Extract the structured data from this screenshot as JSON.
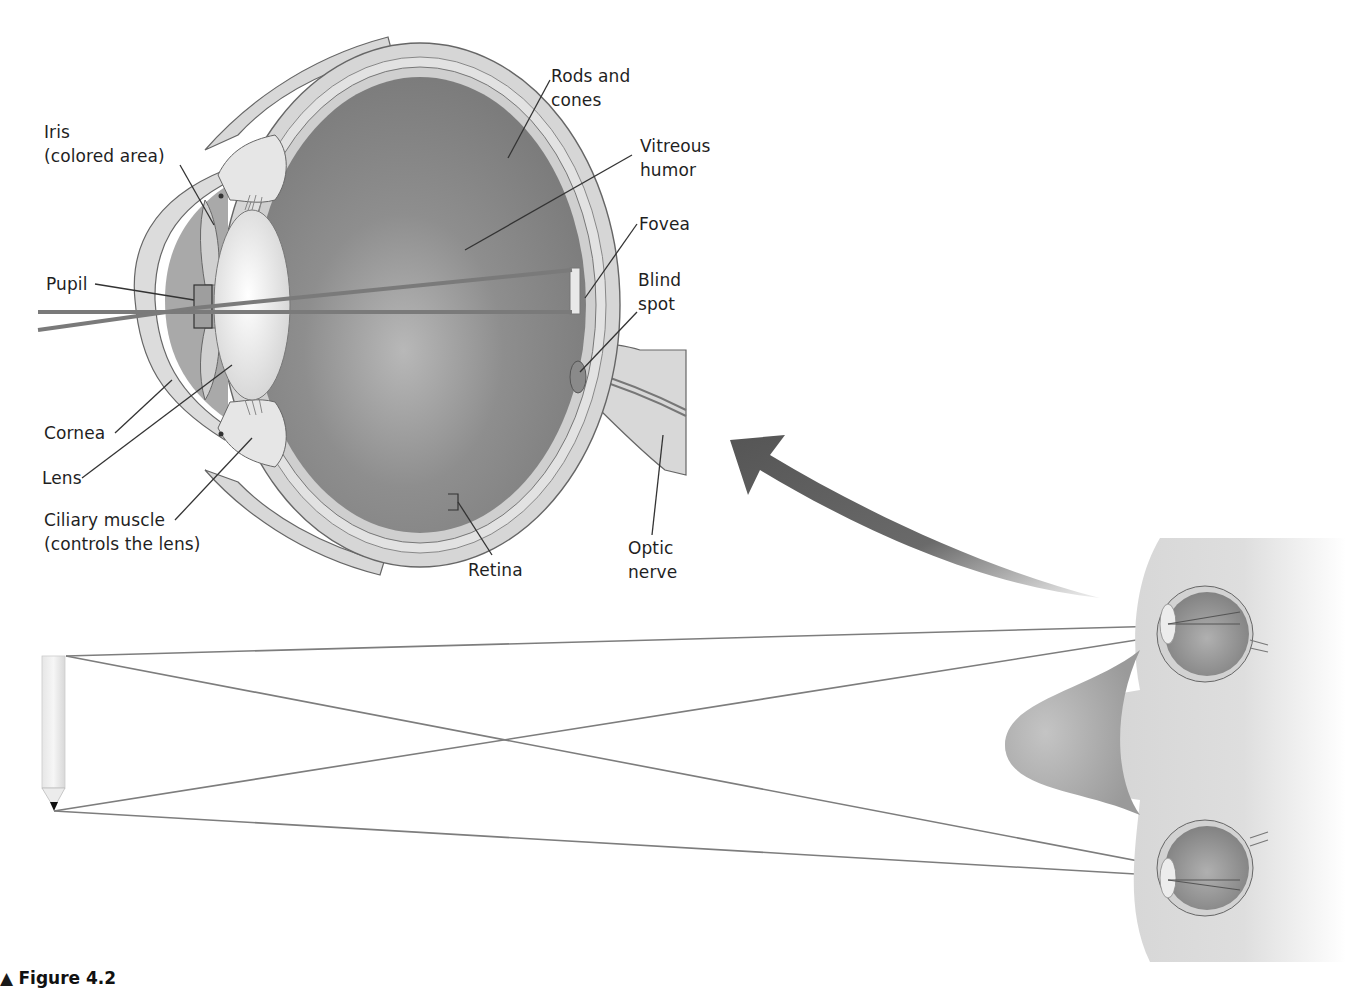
{
  "figure": {
    "caption_marker": "▲",
    "caption_label": "Figure 4.2",
    "caption_text": "The human eye (caption cut off at image bottom)"
  },
  "eye_cross_section": {
    "labels": {
      "iris": "Iris\n(colored area)",
      "pupil": "Pupil",
      "cornea": "Cornea",
      "lens": "Lens",
      "ciliary_muscle": "Ciliary muscle\n(controls the lens)",
      "rods_cones": "Rods and\ncones",
      "vitreous_humor": "Vitreous\nhumor",
      "fovea": "Fovea",
      "blind_spot": "Blind\nspot",
      "retina": "Retina",
      "optic_nerve": "Optic\nnerve"
    }
  },
  "binocular_view": {
    "object": "pencil",
    "rays": 4,
    "viewer": "face-profile-with-two-eyes"
  },
  "colors": {
    "background": "#ffffff",
    "eye_interior": "#8a8a8a",
    "sclera": "#d6d6d6",
    "lens": "#ececec",
    "outline": "#555555",
    "ray": "#7a7a7a",
    "arrow": "#5c5c5c",
    "face": "#c8c8c8"
  }
}
